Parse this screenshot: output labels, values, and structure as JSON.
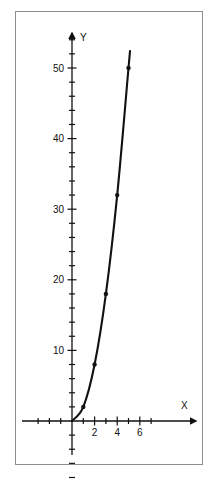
{
  "chart_data": {
    "type": "line",
    "title": "",
    "subtitle": "",
    "xlabel": "X",
    "ylabel": "Y",
    "x": [
      0,
      1,
      2,
      3,
      4,
      5
    ],
    "values": [
      0,
      2,
      8,
      18,
      32,
      50
    ],
    "series": [
      {
        "name": "curve",
        "x": [
          0,
          1,
          2,
          3,
          4,
          5
        ],
        "values": [
          0,
          2,
          8,
          18,
          32,
          50
        ]
      }
    ],
    "markers": [
      {
        "x": 1,
        "y": 2
      },
      {
        "x": 2,
        "y": 8
      },
      {
        "x": 3,
        "y": 18
      },
      {
        "x": 4,
        "y": 32
      },
      {
        "x": 5,
        "y": 50
      }
    ],
    "xlim": [
      -3.5,
      8.2
    ],
    "ylim": [
      -9,
      56
    ],
    "x_tick_values": [
      -3,
      -2,
      -1,
      1,
      2,
      3,
      4,
      5,
      6,
      7
    ],
    "x_tick_labels": [
      "2",
      "4",
      "6"
    ],
    "x_labeled_ticks": [
      2,
      4,
      6
    ],
    "y_tick_values": [
      -8,
      -6,
      -4,
      -2,
      2,
      4,
      6,
      8,
      10,
      12,
      14,
      16,
      18,
      20,
      22,
      24,
      26,
      28,
      30,
      32,
      34,
      36,
      38,
      40,
      42,
      44,
      46,
      48,
      50,
      52,
      54
    ],
    "y_tick_labels": [
      "10",
      "20",
      "30",
      "40",
      "50"
    ],
    "y_labeled_ticks": [
      10,
      20,
      30,
      40,
      50
    ],
    "grid": false,
    "legend": "none",
    "axis_arrows": true,
    "curve_color": "#111111",
    "axis_color": "#111111",
    "frame_color": "#8e8e8e",
    "background_color": "#ffffff"
  },
  "axes": {
    "y_axis_name": "Y",
    "x_axis_name": "X"
  }
}
